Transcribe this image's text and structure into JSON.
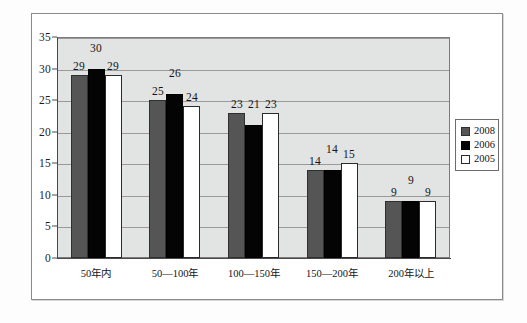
{
  "chart_data": {
    "type": "bar",
    "title": "",
    "subtitle": "",
    "xlabel": "",
    "ylabel": "",
    "grid": true,
    "legend_position": "right",
    "ylim": [
      0,
      35
    ],
    "yticks": [
      0,
      5,
      10,
      15,
      20,
      25,
      30,
      35
    ],
    "ytick_labels": [
      "0",
      "5",
      "10",
      "15",
      "20",
      "25",
      "30",
      "35"
    ],
    "categories": [
      "50年内",
      "50—100年",
      "100—150年",
      "150—200年",
      "200年以上"
    ],
    "series": [
      {
        "name": "2008",
        "color": "#555555",
        "values": [
          29,
          25,
          23,
          14,
          9
        ]
      },
      {
        "name": "2006",
        "color": "#040404",
        "values": [
          30,
          26,
          21,
          14,
          9
        ]
      },
      {
        "name": "2005",
        "color": "#ffffff",
        "values": [
          29,
          24,
          23,
          15,
          9
        ]
      }
    ],
    "data_labels": [
      [
        "29",
        "30",
        "29"
      ],
      [
        "25",
        "26",
        "24"
      ],
      [
        "23",
        "21",
        "23"
      ],
      [
        "14",
        "14",
        "15"
      ],
      [
        "9",
        "9",
        "9"
      ]
    ]
  },
  "legend": {
    "items": [
      {
        "label": "2008",
        "swatch": "dark-gray-swatch"
      },
      {
        "label": "2006",
        "swatch": "black-swatch"
      },
      {
        "label": "2005",
        "swatch": "white-swatch"
      }
    ]
  },
  "colors": {
    "plot_background": "#e2e4e3",
    "gridline": "#9a9a9a",
    "axis": "#4a4a4a",
    "page_border": "#8a8a8a",
    "series_2008": "#555555",
    "series_2006": "#040404",
    "series_2005": "#ffffff"
  }
}
